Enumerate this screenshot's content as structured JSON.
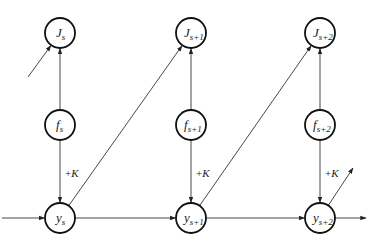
{
  "diagram": {
    "type": "flow-graph",
    "stages": [
      {
        "id": "s",
        "subscript": "s"
      },
      {
        "id": "s+1",
        "subscript": "s+1"
      },
      {
        "id": "s+2",
        "subscript": "s+2"
      }
    ],
    "nodes": [
      {
        "id": "J_s",
        "symbol": "J",
        "subscript": "s",
        "row": "top",
        "stage": 0
      },
      {
        "id": "f_s",
        "symbol": "f",
        "subscript": "s",
        "row": "middle",
        "stage": 0
      },
      {
        "id": "y_s",
        "symbol": "y",
        "subscript": "s",
        "row": "bottom",
        "stage": 0
      },
      {
        "id": "J_s+1",
        "symbol": "J",
        "subscript": "s+1",
        "row": "top",
        "stage": 1
      },
      {
        "id": "f_s+1",
        "symbol": "f",
        "subscript": "s+1",
        "row": "middle",
        "stage": 1
      },
      {
        "id": "y_s+1",
        "symbol": "y",
        "subscript": "s+1",
        "row": "bottom",
        "stage": 1
      },
      {
        "id": "J_s+2",
        "symbol": "J",
        "subscript": "s+2",
        "row": "top",
        "stage": 2
      },
      {
        "id": "f_s+2",
        "symbol": "f",
        "subscript": "s+2",
        "row": "middle",
        "stage": 2
      },
      {
        "id": "y_s+2",
        "symbol": "y",
        "subscript": "s+2",
        "row": "bottom",
        "stage": 2
      }
    ],
    "edges": [
      {
        "from": "f_s",
        "to": "J_s"
      },
      {
        "from": "f_s",
        "to": "y_s",
        "label": "+K"
      },
      {
        "from": "y_s",
        "to": "y_s+1"
      },
      {
        "from": "y_s",
        "to": "J_s+1"
      },
      {
        "from": "f_s+1",
        "to": "J_s+1"
      },
      {
        "from": "f_s+1",
        "to": "y_s+1",
        "label": "+K"
      },
      {
        "from": "y_s+1",
        "to": "y_s+2"
      },
      {
        "from": "y_s+1",
        "to": "J_s+2"
      },
      {
        "from": "f_s+2",
        "to": "J_s+2"
      },
      {
        "from": "f_s+2",
        "to": "y_s+2",
        "label": "+K"
      },
      {
        "from": "external",
        "to": "y_s",
        "kind": "incoming"
      },
      {
        "from": "external",
        "to": "J_s",
        "kind": "incoming"
      },
      {
        "from": "y_s+2",
        "to": "external",
        "kind": "outgoing-right"
      },
      {
        "from": "y_s+2",
        "to": "external",
        "kind": "outgoing-diagonal"
      }
    ],
    "gain_label": "+",
    "gain_symbol": "K"
  }
}
